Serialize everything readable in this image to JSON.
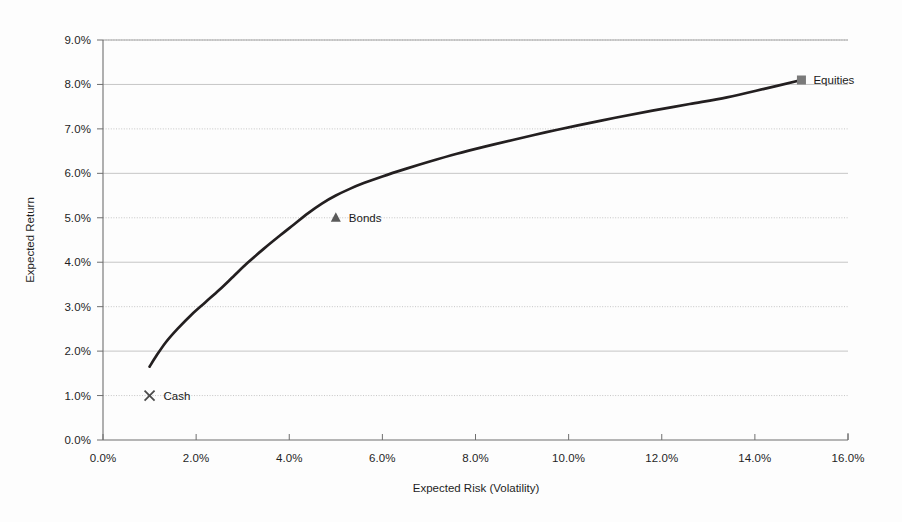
{
  "chart_data": {
    "type": "line",
    "title": "",
    "subtitle": "",
    "xlabel": "Expected Risk (Volatility)",
    "ylabel": "Expected Return",
    "xlim": [
      0,
      16
    ],
    "ylim": [
      0,
      9
    ],
    "grid": true,
    "legend_position": "none",
    "x_tick_labels": [
      "0.0%",
      "2.0%",
      "4.0%",
      "6.0%",
      "8.0%",
      "10.0%",
      "12.0%",
      "14.0%",
      "16.0%"
    ],
    "x_tick_values": [
      0,
      2,
      4,
      6,
      8,
      10,
      12,
      14,
      16
    ],
    "y_tick_labels": [
      "0.0%",
      "1.0%",
      "2.0%",
      "3.0%",
      "4.0%",
      "5.0%",
      "6.0%",
      "7.0%",
      "8.0%",
      "9.0%"
    ],
    "y_tick_values": [
      0,
      1,
      2,
      3,
      4,
      5,
      6,
      7,
      8,
      9
    ],
    "series": [
      {
        "name": "Efficient Frontier",
        "type": "line",
        "color": "#231f20",
        "x": [
          1.0,
          1.15,
          1.35,
          1.6,
          1.9,
          2.2,
          2.5,
          2.8,
          3.1,
          3.45,
          3.8,
          4.1,
          4.4,
          4.7,
          5.0,
          5.3,
          5.6,
          6.0,
          6.5,
          7.0,
          7.6,
          8.2,
          8.8,
          9.5,
          10.2,
          11.0,
          11.8,
          12.6,
          13.4,
          14.2,
          15.0
        ],
        "y": [
          1.65,
          1.9,
          2.2,
          2.5,
          2.82,
          3.1,
          3.38,
          3.68,
          3.98,
          4.3,
          4.6,
          4.85,
          5.1,
          5.32,
          5.5,
          5.65,
          5.78,
          5.93,
          6.1,
          6.26,
          6.44,
          6.6,
          6.75,
          6.92,
          7.08,
          7.25,
          7.41,
          7.56,
          7.71,
          7.9,
          8.1
        ]
      }
    ],
    "points": [
      {
        "name": "Cash",
        "label": "Cash",
        "marker": "x",
        "x": 1.0,
        "y": 1.0,
        "color": "#4a4a4a",
        "label_offset_x": 14,
        "label_offset_y": 4
      },
      {
        "name": "Bonds",
        "label": "Bonds",
        "marker": "triangle",
        "x": 5.0,
        "y": 5.0,
        "color": "#5a5a5a",
        "label_offset_x": 13,
        "label_offset_y": 4
      },
      {
        "name": "Equities",
        "label": "Equities",
        "marker": "square",
        "x": 15.0,
        "y": 8.1,
        "color": "#7a7a7a",
        "label_offset_x": 12,
        "label_offset_y": 4
      }
    ],
    "colors": {
      "curve": "#231f20",
      "gridline": "#b8b8b8",
      "axis": "#6f6f6f",
      "text": "#1f1f1f",
      "background": "#fdfdfd"
    },
    "plot_area": {
      "left": 103,
      "right": 848,
      "top": 40,
      "bottom": 440
    }
  }
}
